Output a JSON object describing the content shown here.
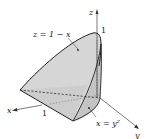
{
  "diagram": {
    "title": "",
    "colors": {
      "surface_fill": "#cfcfcf",
      "surface_fill_light": "#dcdcdc",
      "edge": "#222222",
      "axis": "#444444"
    },
    "axes": {
      "x_label": "x",
      "y_label": "y",
      "z_label": "z"
    },
    "ticks": {
      "x_one": "1",
      "z_one": "1"
    },
    "annotations": {
      "top_surface": "z = 1 − x",
      "side_surface": "x = y²"
    }
  }
}
